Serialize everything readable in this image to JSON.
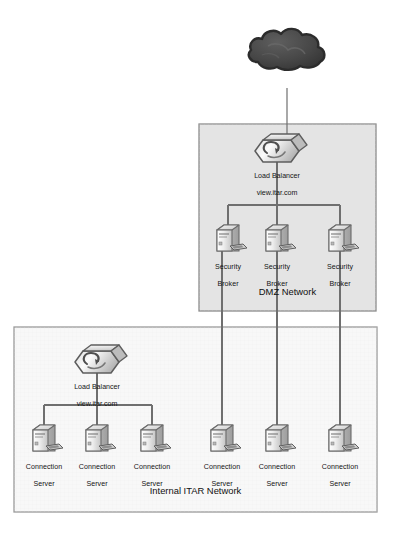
{
  "diagram": {
    "canvas": {
      "width": 395,
      "height": 533
    },
    "colors": {
      "cloud_fill": "#4a4a4a",
      "cloud_stroke": "#2e2e2e",
      "dmz_fill": "#e4e4e4",
      "dmz_stroke": "#8d8d8d",
      "internal_fill": "#f8f8f8",
      "internal_stroke": "#9a9a9a",
      "link_stroke": "#6f6f6f",
      "thin_link_stroke": "#7a7a7a",
      "server_light": "#f2f2f2",
      "server_mid": "#d2d2d2",
      "server_dark": "#a8a8a8",
      "server_stroke": "#6b6b6b",
      "text": "#141414"
    },
    "cloud": {
      "name": "internet-cloud",
      "label": "",
      "cx": 287,
      "cy": 60
    },
    "zones": [
      {
        "id": "dmz",
        "label": "DMZ Network",
        "x": 199,
        "y": 124,
        "width": 177,
        "height": 187,
        "label_x": 199,
        "label_y": 288,
        "fill": "#e4e4e4",
        "stroke": "#8d8d8d"
      },
      {
        "id": "internal",
        "label": "Internal ITAR Network",
        "x": 14,
        "y": 327,
        "width": 363,
        "height": 185,
        "label_x": 14,
        "label_y": 487,
        "fill": "#f8f8f8",
        "stroke": "#9a9a9a"
      }
    ],
    "load_balancers": [
      {
        "id": "dmz-load-balancer",
        "name": "load-balancer-dmz",
        "label_line1": "Load Balancer",
        "label_line2": "view.itar.com",
        "cx": 277,
        "cy": 151,
        "label_x": 277,
        "label_y": 168
      },
      {
        "id": "internal-load-balancer",
        "name": "load-balancer-internal",
        "label_line1": "Load Balancer",
        "label_line2": "view.itar.com",
        "cx": 97,
        "cy": 362,
        "label_x": 97,
        "label_y": 379
      }
    ],
    "servers": [
      {
        "id": "sb1",
        "name": "security-broker-1",
        "zone": "dmz",
        "label_line1": "Security",
        "label_line2": "Broker",
        "cx": 228,
        "cy": 240,
        "label_y": 258
      },
      {
        "id": "sb2",
        "name": "security-broker-2",
        "zone": "dmz",
        "label_line1": "Security",
        "label_line2": "Broker",
        "cx": 277,
        "cy": 240,
        "label_y": 258
      },
      {
        "id": "sb3",
        "name": "security-broker-3",
        "zone": "dmz",
        "label_line1": "Security",
        "label_line2": "Broker",
        "cx": 340,
        "cy": 240,
        "label_y": 258
      },
      {
        "id": "cs1",
        "name": "connection-server-1",
        "zone": "internal",
        "label_line1": "Connection",
        "label_line2": "Server",
        "cx": 44,
        "cy": 440,
        "label_y": 458
      },
      {
        "id": "cs2",
        "name": "connection-server-2",
        "zone": "internal",
        "label_line1": "Connection",
        "label_line2": "Server",
        "cx": 97,
        "cy": 440,
        "label_y": 458
      },
      {
        "id": "cs3",
        "name": "connection-server-3",
        "zone": "internal",
        "label_line1": "Connection",
        "label_line2": "Server",
        "cx": 152,
        "cy": 440,
        "label_y": 458
      },
      {
        "id": "cs4",
        "name": "connection-server-4",
        "zone": "internal",
        "label_line1": "Connection",
        "label_line2": "Server",
        "cx": 222,
        "cy": 440,
        "label_y": 458
      },
      {
        "id": "cs5",
        "name": "connection-server-5",
        "zone": "internal",
        "label_line1": "Connection",
        "label_line2": "Server",
        "cx": 277,
        "cy": 440,
        "label_y": 458
      },
      {
        "id": "cs6",
        "name": "connection-server-6",
        "zone": "internal",
        "label_line1": "Connection",
        "label_line2": "Server",
        "cx": 340,
        "cy": 440,
        "label_y": 458
      }
    ],
    "links": {
      "cloud_to_dmz_lb": {
        "x": 287,
        "y1": 88,
        "y2": 136
      },
      "dmz_bus": {
        "y": 205,
        "x1": 228,
        "x2": 340,
        "stem_x": 277,
        "stem_y1": 184,
        "stem_y2": 205
      },
      "dmz_bus_drops": [
        {
          "x": 228,
          "y1": 205,
          "y2": 224
        },
        {
          "x": 277,
          "y1": 205,
          "y2": 224
        },
        {
          "x": 340,
          "y1": 205,
          "y2": 224
        }
      ],
      "dmz_to_internal_trunks": [
        {
          "x": 222,
          "y1": 248,
          "y2": 424
        },
        {
          "x": 277,
          "y1": 248,
          "y2": 424
        },
        {
          "x": 340,
          "y1": 248,
          "y2": 424
        }
      ],
      "internal_bus": {
        "y": 405,
        "x1": 44,
        "x2": 152,
        "stem_x": 97,
        "stem_y1": 395,
        "stem_y2": 405
      },
      "internal_bus_drops": [
        {
          "x": 44,
          "y1": 405,
          "y2": 424
        },
        {
          "x": 97,
          "y1": 405,
          "y2": 424
        },
        {
          "x": 152,
          "y1": 405,
          "y2": 424
        }
      ]
    }
  }
}
